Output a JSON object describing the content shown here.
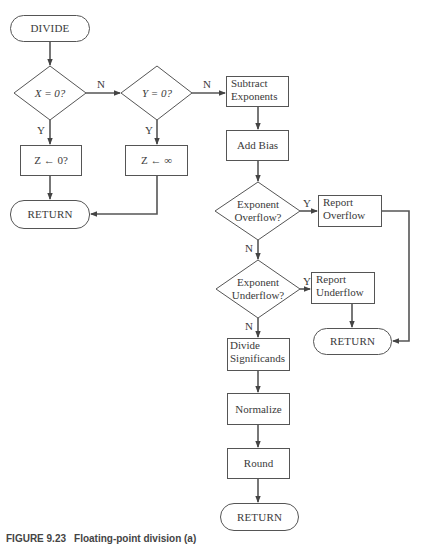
{
  "figure": {
    "caption_label": "FIGURE 9.23",
    "caption_text": "Floating-point division (a)"
  },
  "nodes": {
    "start": {
      "label": "DIVIDE",
      "type": "terminal"
    },
    "check_x": {
      "label": "X = 0?",
      "type": "decision"
    },
    "check_y": {
      "label": "Y = 0?",
      "type": "decision"
    },
    "z_zero": {
      "label": "Z ← 0?",
      "type": "process"
    },
    "z_inf": {
      "label": "Z ← ∞",
      "type": "process"
    },
    "return_left": {
      "label": "RETURN",
      "type": "terminal"
    },
    "subtract_exp": {
      "line1": "Subtract",
      "line2": "Exponents",
      "type": "process"
    },
    "add_bias": {
      "label": "Add Bias",
      "type": "process"
    },
    "exp_overflow": {
      "line1": "Exponent",
      "line2": "Overflow?",
      "type": "decision"
    },
    "report_overflow": {
      "line1": "Report",
      "line2": "Overflow",
      "type": "process"
    },
    "exp_underflow": {
      "line1": "Exponent",
      "line2": "Underflow?",
      "type": "decision"
    },
    "report_underflow": {
      "line1": "Report",
      "line2": "Underflow",
      "type": "process"
    },
    "return_right": {
      "label": "RETURN",
      "type": "terminal"
    },
    "divide_sig": {
      "line1": "Divide",
      "line2": "Significands",
      "type": "process"
    },
    "normalize": {
      "label": "Normalize",
      "type": "process"
    },
    "round": {
      "label": "Round",
      "type": "process"
    },
    "return_bottom": {
      "label": "RETURN",
      "type": "terminal"
    }
  },
  "edges": {
    "x_no": "N",
    "x_yes": "Y",
    "y_no": "N",
    "y_yes": "Y",
    "overflow_yes": "Y",
    "overflow_no": "N",
    "underflow_yes": "Y",
    "underflow_no": "N"
  },
  "colors": {
    "stroke": "#555555",
    "text": "#3a3a3a",
    "background": "#ffffff"
  }
}
